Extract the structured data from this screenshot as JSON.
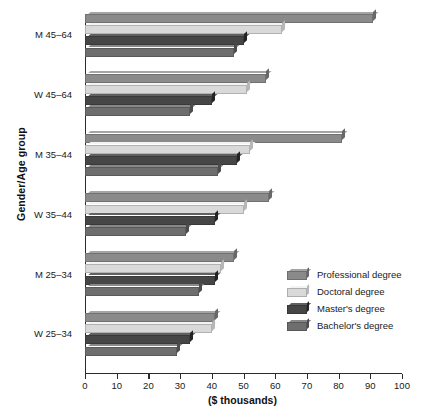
{
  "chart_data": {
    "type": "bar",
    "orientation": "horizontal",
    "title": "",
    "xlabel": "($ thousands)",
    "ylabel": "Gender/Age group",
    "xlim": [
      0,
      100
    ],
    "xticks": [
      0,
      10,
      20,
      30,
      40,
      50,
      60,
      70,
      80,
      90,
      100
    ],
    "grid": false,
    "legend_position": "right-inside",
    "categories": [
      "M 45–64",
      "W 45–64",
      "M 35–44",
      "W 35–44",
      "M 25–34",
      "W 25–34"
    ],
    "series": [
      {
        "name": "Professional degree",
        "color": "#8a8a8a",
        "values": [
          91,
          57,
          81,
          58,
          47,
          41
        ]
      },
      {
        "name": "Doctoral degree",
        "color": "#d9d9d9",
        "values": [
          62,
          51,
          52,
          50,
          43,
          40
        ]
      },
      {
        "name": "Master's degree",
        "color": "#464646",
        "values": [
          50,
          40,
          48,
          41,
          41,
          33
        ]
      },
      {
        "name": "Bachelor's degree",
        "color": "#6e6e6e",
        "values": [
          47,
          33,
          42,
          32,
          36,
          29
        ]
      }
    ]
  },
  "axis": {
    "y_title": "Gender/Age group",
    "x_title": "($ thousands)",
    "x_tick_labels": [
      "0",
      "10",
      "20",
      "30",
      "40",
      "50",
      "60",
      "70",
      "80",
      "90",
      "100"
    ],
    "category_labels": [
      "M 45–64",
      "W 45–64",
      "M 35–44",
      "W 35–44",
      "M 25–34",
      "W 25–34"
    ]
  },
  "legend": {
    "items": [
      {
        "label": "Professional degree",
        "color": "#8a8a8a"
      },
      {
        "label": "Doctoral degree",
        "color": "#d9d9d9"
      },
      {
        "label": "Master's degree",
        "color": "#464646"
      },
      {
        "label": "Bachelor's degree",
        "color": "#6e6e6e"
      }
    ]
  },
  "colors": {
    "axis": "#2b2b2b",
    "text": "#1a1a1a",
    "background": "#ffffff"
  }
}
